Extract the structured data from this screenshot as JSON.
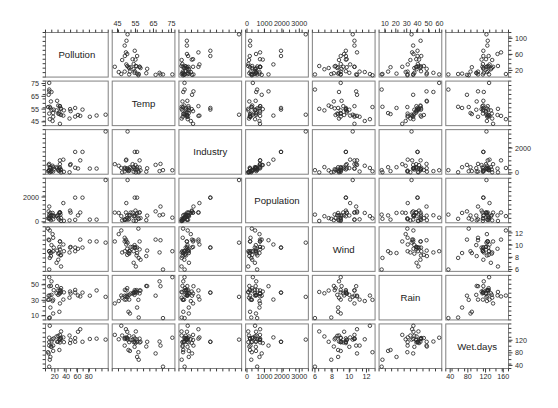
{
  "figure": {
    "type": "scatterplot-matrix",
    "title": "",
    "background": "#ffffff",
    "point_color": "#2a2a2a",
    "panel_border_color": "#808080",
    "n_observations": 41,
    "n_variables": 7
  },
  "chart_data": {
    "type": "scatter",
    "title": "",
    "xlabel": "",
    "ylabel": "",
    "layout": "scatterplot matrix (pairs plot), 7x7 panels, diagonal holds variable names, axis ticks alternate between outer edges",
    "grid": false,
    "legend": null,
    "variables": [
      {
        "name": "Pollution",
        "index": 0,
        "axis_ticks_bottom": [
          20,
          40,
          60,
          80
        ],
        "axis_ticks_right": [
          20,
          60,
          100
        ],
        "range": [
          9,
          110
        ]
      },
      {
        "name": "Temp",
        "index": 1,
        "axis_ticks_top": [
          45,
          55,
          65,
          75
        ],
        "axis_ticks_left": [
          45,
          55,
          65,
          75
        ],
        "range": [
          43.5,
          75.5
        ]
      },
      {
        "name": "Industry",
        "index": 2,
        "axis_ticks_right": [
          0,
          2000
        ],
        "range": [
          35,
          3344
        ]
      },
      {
        "name": "Population",
        "index": 3,
        "axis_ticks_top": [
          0,
          1000,
          2000,
          3000
        ],
        "axis_ticks_bottom": [
          0,
          1000,
          2000,
          3000
        ],
        "axis_ticks_left": [
          0,
          2000
        ],
        "range": [
          71,
          3369
        ]
      },
      {
        "name": "Wind",
        "index": 4,
        "axis_ticks_bottom": [
          6,
          8,
          10,
          12
        ],
        "axis_ticks_right": [
          6,
          8,
          10,
          12
        ],
        "range": [
          6.0,
          12.7
        ]
      },
      {
        "name": "Rain",
        "index": 5,
        "axis_ticks_top": [
          10,
          20,
          30,
          40,
          50,
          60
        ],
        "axis_ticks_left": [
          10,
          30,
          50
        ],
        "range": [
          7.05,
          59.8
        ]
      },
      {
        "name": "Wet.days",
        "index": 6,
        "axis_ticks_bottom": [
          40,
          80,
          120,
          160
        ],
        "axis_ticks_right": [
          40,
          80,
          120
        ],
        "range": [
          36,
          166
        ]
      }
    ],
    "observations": [
      {
        "Pollution": 46,
        "Temp": 47.6,
        "Industry": 44,
        "Population": 116,
        "Wind": 8.8,
        "Rain": 33.36,
        "Wet.days": 135
      },
      {
        "Pollution": 11,
        "Temp": 56.8,
        "Industry": 46,
        "Population": 244,
        "Wind": 7.9,
        "Rain": 7.77,
        "Wet.days": 58
      },
      {
        "Pollution": 24,
        "Temp": 61.5,
        "Industry": 368,
        "Population": 497,
        "Wind": 9.1,
        "Rain": 48.34,
        "Wet.days": 115
      },
      {
        "Pollution": 47,
        "Temp": 55.0,
        "Industry": 625,
        "Population": 905,
        "Wind": 9.6,
        "Rain": 41.31,
        "Wet.days": 111
      },
      {
        "Pollution": 11,
        "Temp": 47.1,
        "Industry": 391,
        "Population": 463,
        "Wind": 12.4,
        "Rain": 36.11,
        "Wet.days": 166
      },
      {
        "Pollution": 31,
        "Temp": 55.2,
        "Industry": 35,
        "Population": 71,
        "Wind": 6.5,
        "Rain": 40.75,
        "Wet.days": 148
      },
      {
        "Pollution": 110,
        "Temp": 50.6,
        "Industry": 3344,
        "Population": 3369,
        "Wind": 10.4,
        "Rain": 34.44,
        "Wet.days": 122
      },
      {
        "Pollution": 23,
        "Temp": 54.0,
        "Industry": 462,
        "Population": 453,
        "Wind": 7.1,
        "Rain": 39.04,
        "Wet.days": 132
      },
      {
        "Pollution": 65,
        "Temp": 49.7,
        "Industry": 1007,
        "Population": 751,
        "Wind": 10.9,
        "Rain": 34.99,
        "Wet.days": 155
      },
      {
        "Pollution": 26,
        "Temp": 51.5,
        "Industry": 266,
        "Population": 540,
        "Wind": 8.6,
        "Rain": 37.01,
        "Wet.days": 134
      },
      {
        "Pollution": 9,
        "Temp": 66.2,
        "Industry": 641,
        "Population": 844,
        "Wind": 10.9,
        "Rain": 35.94,
        "Wet.days": 78
      },
      {
        "Pollution": 17,
        "Temp": 51.9,
        "Industry": 454,
        "Population": 515,
        "Wind": 9.0,
        "Rain": 12.95,
        "Wet.days": 86
      },
      {
        "Pollution": 17,
        "Temp": 49.0,
        "Industry": 104,
        "Population": 201,
        "Wind": 11.2,
        "Rain": 30.85,
        "Wet.days": 103
      },
      {
        "Pollution": 35,
        "Temp": 49.9,
        "Industry": 1064,
        "Population": 1513,
        "Wind": 10.1,
        "Rain": 30.96,
        "Wet.days": 129
      },
      {
        "Pollution": 56,
        "Temp": 49.1,
        "Industry": 412,
        "Population": 158,
        "Wind": 9.0,
        "Rain": 43.37,
        "Wet.days": 127
      },
      {
        "Pollution": 10,
        "Temp": 68.9,
        "Industry": 721,
        "Population": 1233,
        "Wind": 10.8,
        "Rain": 48.19,
        "Wet.days": 103
      },
      {
        "Pollution": 28,
        "Temp": 52.3,
        "Industry": 361,
        "Population": 746,
        "Wind": 9.7,
        "Rain": 38.74,
        "Wet.days": 121
      },
      {
        "Pollution": 14,
        "Temp": 68.4,
        "Industry": 136,
        "Population": 529,
        "Wind": 8.8,
        "Rain": 54.47,
        "Wet.days": 116
      },
      {
        "Pollution": 14,
        "Temp": 54.5,
        "Industry": 381,
        "Population": 507,
        "Wind": 10.0,
        "Rain": 37.0,
        "Wet.days": 99
      },
      {
        "Pollution": 13,
        "Temp": 61.0,
        "Industry": 91,
        "Population": 132,
        "Wind": 8.2,
        "Rain": 48.52,
        "Wet.days": 100
      },
      {
        "Pollution": 30,
        "Temp": 55.6,
        "Industry": 291,
        "Population": 593,
        "Wind": 8.3,
        "Rain": 43.11,
        "Wet.days": 123
      },
      {
        "Pollution": 10,
        "Temp": 75.5,
        "Industry": 207,
        "Population": 335,
        "Wind": 9.0,
        "Rain": 59.8,
        "Wet.days": 128
      },
      {
        "Pollution": 10,
        "Temp": 51.5,
        "Industry": 181,
        "Population": 255,
        "Wind": 9.0,
        "Rain": 30.85,
        "Wet.days": 114
      },
      {
        "Pollution": 16,
        "Temp": 45.7,
        "Industry": 569,
        "Population": 717,
        "Wind": 11.8,
        "Rain": 29.07,
        "Wet.days": 123
      },
      {
        "Pollution": 29,
        "Temp": 43.5,
        "Industry": 699,
        "Population": 744,
        "Wind": 10.6,
        "Rain": 25.94,
        "Wet.days": 137
      },
      {
        "Pollution": 61,
        "Temp": 50.4,
        "Industry": 347,
        "Population": 520,
        "Wind": 9.4,
        "Rain": 36.22,
        "Wet.days": 147
      },
      {
        "Pollution": 94,
        "Temp": 50.0,
        "Industry": 343,
        "Population": 179,
        "Wind": 10.6,
        "Rain": 42.75,
        "Wet.days": 125
      },
      {
        "Pollution": 26,
        "Temp": 57.8,
        "Industry": 197,
        "Population": 299,
        "Wind": 7.6,
        "Rain": 42.59,
        "Wet.days": 115
      },
      {
        "Pollution": 28,
        "Temp": 51.1,
        "Industry": 137,
        "Population": 176,
        "Wind": 8.7,
        "Rain": 15.17,
        "Wet.days": 89
      },
      {
        "Pollution": 12,
        "Temp": 55.9,
        "Industry": 453,
        "Population": 716,
        "Wind": 8.7,
        "Rain": 20.66,
        "Wet.days": 67
      },
      {
        "Pollution": 29,
        "Temp": 57.3,
        "Industry": 434,
        "Population": 757,
        "Wind": 9.3,
        "Rain": 38.89,
        "Wet.days": 113
      },
      {
        "Pollution": 56,
        "Temp": 55.9,
        "Industry": 1692,
        "Population": 1950,
        "Wind": 9.6,
        "Rain": 39.93,
        "Wet.days": 115
      },
      {
        "Pollution": 29,
        "Temp": 57.3,
        "Industry": 1007,
        "Population": 751,
        "Wind": 10.6,
        "Rain": 42.75,
        "Wet.days": 125
      },
      {
        "Pollution": 8,
        "Temp": 56.6,
        "Industry": 125,
        "Population": 277,
        "Wind": 12.7,
        "Rain": 30.58,
        "Wet.days": 82
      },
      {
        "Pollution": 36,
        "Temp": 54.0,
        "Industry": 80,
        "Population": 80,
        "Wind": 9.0,
        "Rain": 40.25,
        "Wet.days": 114
      },
      {
        "Pollution": 82,
        "Temp": 49.0,
        "Industry": 343,
        "Population": 179,
        "Wind": 10.6,
        "Rain": 35.94,
        "Wet.days": 124
      },
      {
        "Pollution": 10,
        "Temp": 70.3,
        "Industry": 213,
        "Population": 582,
        "Wind": 6.0,
        "Rain": 7.05,
        "Wet.days": 36
      },
      {
        "Pollution": 31,
        "Temp": 50.4,
        "Industry": 224,
        "Population": 299,
        "Wind": 8.4,
        "Rain": 45.7,
        "Wet.days": 127
      },
      {
        "Pollution": 18,
        "Temp": 54.6,
        "Industry": 275,
        "Population": 448,
        "Wind": 9.6,
        "Rain": 43.11,
        "Wet.days": 126
      },
      {
        "Pollution": 69,
        "Temp": 54.6,
        "Industry": 1692,
        "Population": 1950,
        "Wind": 9.6,
        "Rain": 39.93,
        "Wet.days": 115
      },
      {
        "Pollution": 48,
        "Temp": 53.4,
        "Industry": 699,
        "Population": 744,
        "Wind": 9.7,
        "Rain": 38.74,
        "Wet.days": 121
      }
    ]
  }
}
